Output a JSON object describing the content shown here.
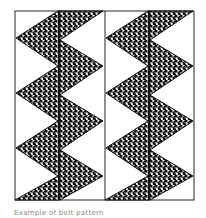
{
  "figure": {
    "frame": {
      "x": 15,
      "y": 11,
      "width": 179,
      "height": 189
    },
    "columns": 2,
    "stroke_color": "#111111",
    "background_color": "#ffffff"
  },
  "caption": {
    "text": "Example of bolt pattern"
  }
}
